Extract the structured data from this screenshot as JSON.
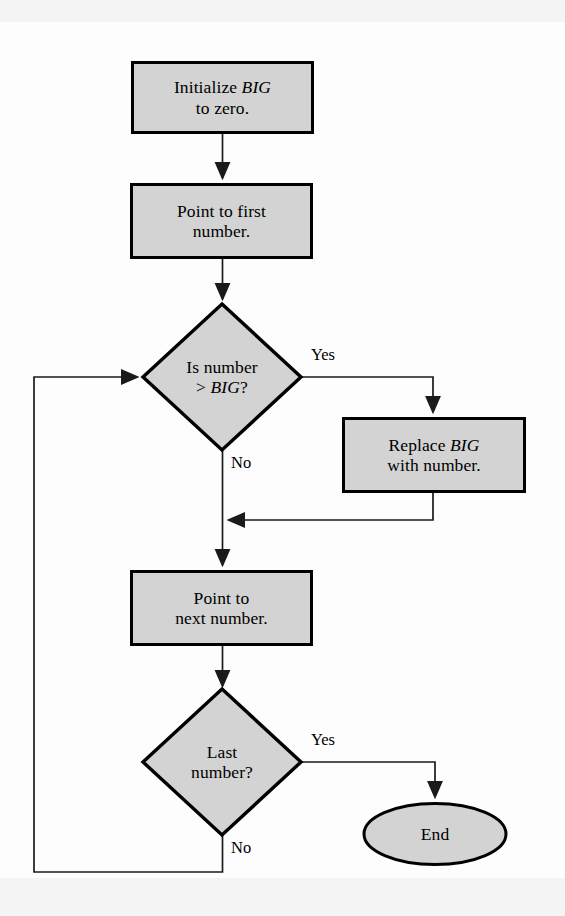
{
  "figure": {
    "type": "flowchart",
    "background_color": "#fdfdfd",
    "node_fill_color": "#d3d3d3",
    "node_stroke_color": "#000000",
    "connector_color": "#1a1a1a"
  },
  "nodes": [
    {
      "id": "init",
      "shape": "process",
      "text": "Initialize BIG\nto zero.",
      "line1_prefix": "Initialize ",
      "line1_emphasis": "BIG",
      "line2": "to zero.",
      "x": 132,
      "y": 62,
      "w": 181,
      "h": 71
    },
    {
      "id": "point-first",
      "shape": "process",
      "text": "Point to first\nnumber.",
      "line1_prefix": "Point to first",
      "line1_emphasis": "",
      "line2": "number.",
      "x": 131,
      "y": 184,
      "w": 181,
      "h": 74
    },
    {
      "id": "is-number-bigger",
      "shape": "decision",
      "text": "Is number\n> BIG?",
      "line1_prefix": "Is number",
      "line1_emphasis": "",
      "line2_prefix": "> ",
      "line2_emphasis": "BIG",
      "line2_suffix": "?",
      "cx": 222,
      "cy": 377,
      "rx": 79,
      "ry": 72
    },
    {
      "id": "replace-big",
      "shape": "process",
      "text": "Replace BIG\nwith number.",
      "line1_prefix": "Replace ",
      "line1_emphasis": "BIG",
      "line2": "with number.",
      "x": 343,
      "y": 418,
      "w": 182,
      "h": 74
    },
    {
      "id": "point-next",
      "shape": "process",
      "text": "Point to\nnext number.",
      "line1_prefix": "Point to",
      "line1_emphasis": "",
      "line2": "next number.",
      "x": 131,
      "y": 571,
      "w": 181,
      "h": 74
    },
    {
      "id": "last-number",
      "shape": "decision",
      "text": "Last\nnumber?",
      "line1_prefix": "Last",
      "line1_emphasis": "",
      "line2_prefix": "number?",
      "line2_emphasis": "",
      "line2_suffix": "",
      "cx": 222,
      "cy": 762,
      "rx": 79,
      "ry": 72
    },
    {
      "id": "end",
      "shape": "terminator",
      "text": "End",
      "cx": 435,
      "cy": 834,
      "rx": 72,
      "ry": 31
    }
  ],
  "edge_labels": [
    {
      "id": "yes-bigger",
      "text": "Yes",
      "x": 311,
      "y": 347
    },
    {
      "id": "no-bigger",
      "text": "No",
      "x": 231,
      "y": 455
    },
    {
      "id": "yes-last",
      "text": "Yes",
      "x": 311,
      "y": 732
    },
    {
      "id": "no-last",
      "text": "No",
      "x": 231,
      "y": 840
    }
  ],
  "flow": {
    "start_node": "init",
    "end_node": "end",
    "loop_back_to": "is-number-bigger",
    "steps": [
      "Initialize BIG to zero.",
      "Point to first number.",
      "Is number > BIG?",
      "Yes: Replace BIG with number.",
      "No: continue",
      "Point to next number.",
      "Last number?",
      "Yes: End",
      "No: loop back to 'Is number > BIG?'"
    ]
  }
}
